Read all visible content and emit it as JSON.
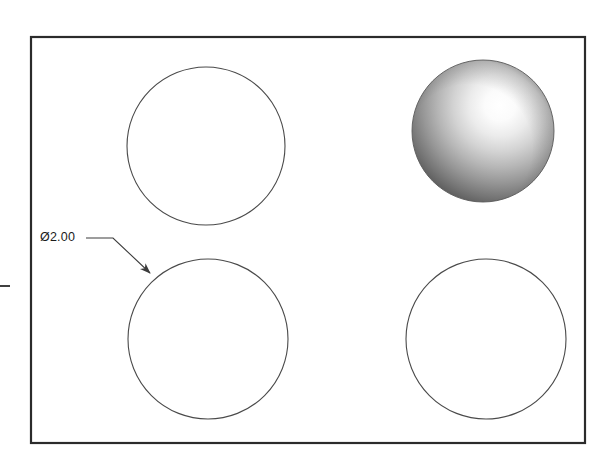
{
  "drawing": {
    "title": "Engineering drawing view with four circular features",
    "background_color": "#ffffff",
    "line_color": "#3c3c3c",
    "frame_color": "#2b2b2b",
    "text_color": "#1b1b1b",
    "frame": {
      "name": "view-border",
      "x": 31,
      "y": 37,
      "width": 554,
      "height": 406,
      "stroke_width": 2.2
    },
    "left_tick": {
      "name": "left-edge-tick",
      "x1": 0,
      "y1": 286,
      "x2": 10,
      "y2": 286,
      "stroke_width": 1.8
    },
    "circles": [
      {
        "name": "circle-top-left",
        "cx": 206,
        "cy": 146,
        "r": 79,
        "style": "outline",
        "stroke_width": 1.1
      },
      {
        "name": "circle-bottom-left",
        "cx": 208,
        "cy": 339,
        "r": 80,
        "style": "outline",
        "stroke_width": 1.1
      },
      {
        "name": "circle-bottom-right",
        "cx": 486,
        "cy": 339,
        "r": 80,
        "style": "outline",
        "stroke_width": 1.1
      },
      {
        "name": "sphere-top-right",
        "cx": 483,
        "cy": 131,
        "r": 71,
        "style": "shaded-sphere",
        "highlight_cx": 500,
        "highlight_cy": 105,
        "highlight_color": "#ffffff",
        "midtone_color": "#b9b9b9",
        "shadow_color": "#4a4a4a",
        "edge_color": "#6d6d6d"
      }
    ],
    "dimension": {
      "name": "diameter-dimension",
      "label": "Ø2.00",
      "symbol": "Ø",
      "value": "2.00",
      "text_x": 40,
      "text_y": 231,
      "leader": {
        "name": "leader-line",
        "horizontal_start_x": 86,
        "horizontal_start_y": 238,
        "elbow_x": 113,
        "elbow_y": 238,
        "arrow_tip_x": 150,
        "arrow_tip_y": 273,
        "stroke_width": 1.1
      }
    }
  }
}
